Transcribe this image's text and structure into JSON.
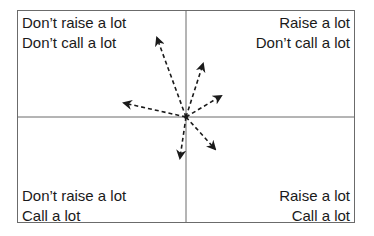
{
  "quadrants": {
    "top_left": {
      "line1": "Don’t raise a lot",
      "line2": "Don’t call a lot"
    },
    "top_right": {
      "line1": "Raise a lot",
      "line2": "Don’t call a lot"
    },
    "bottom_left": {
      "line1": "Don’t raise a lot",
      "line2": "Call a lot"
    },
    "bottom_right": {
      "line1": "Raise a lot",
      "line2": "Call a lot"
    }
  },
  "axes": {
    "horizontal_meaning": "Raising frequency (left = don't raise a lot, right = raise a lot)",
    "vertical_meaning": "Calling frequency (top = don't call a lot, bottom = call a lot)"
  },
  "arrows": {
    "origin": [
      186,
      117
    ],
    "style": "dashed",
    "color": "#1a1a1a",
    "tips": [
      [
        157,
        38
      ],
      [
        124,
        103
      ],
      [
        203,
        64
      ],
      [
        221,
        96
      ],
      [
        215,
        149
      ],
      [
        180,
        158
      ]
    ]
  }
}
